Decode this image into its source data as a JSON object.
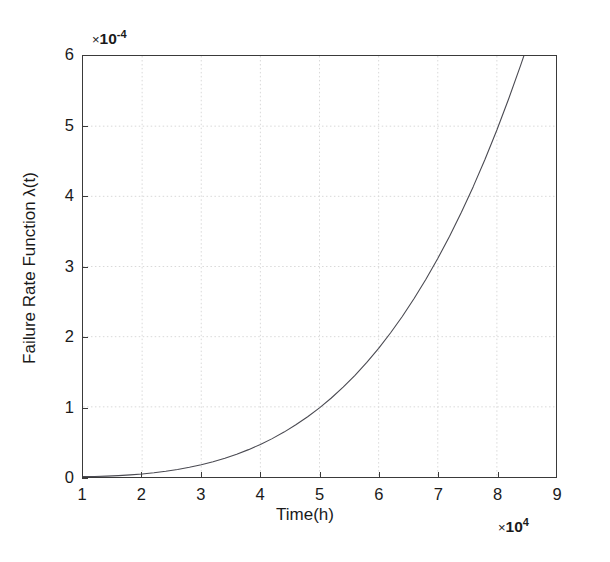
{
  "figure": {
    "background_color": "#ffffff",
    "axis_color": "#3a3a3a",
    "grid_color": "#d9d9d9",
    "curve_color": "#4a4a52"
  },
  "axes": {
    "x_title": "Time(h)",
    "y_title": "Failure Rate Function λ(t)",
    "x_exponent_times": "×",
    "x_exponent_base": "10",
    "x_exponent_power": "4",
    "y_exponent_times": "×",
    "y_exponent_base": "10",
    "y_exponent_power": "-4",
    "x_ticks": [
      "1",
      "2",
      "3",
      "4",
      "5",
      "6",
      "7",
      "8",
      "9"
    ],
    "y_ticks": [
      "0",
      "1",
      "2",
      "3",
      "4",
      "5",
      "6"
    ]
  },
  "chart_data": {
    "type": "line",
    "title": "",
    "subtitle": "",
    "xlabel": "Time(h)",
    "ylabel": "Failure Rate Function λ(t)",
    "x_scale_factor": 10000,
    "y_scale_factor": 0.0001,
    "x_exponent_label": "×10^4",
    "y_exponent_label": "×10^-4",
    "xlim": [
      1,
      9
    ],
    "ylim": [
      0,
      6
    ],
    "xticks": [
      1,
      2,
      3,
      4,
      5,
      6,
      7,
      8,
      9
    ],
    "yticks": [
      0,
      1,
      2,
      3,
      4,
      5,
      6
    ],
    "grid": true,
    "grid_style": "dotted-light",
    "legend": null,
    "legend_position": "none",
    "annotations": [],
    "series": [
      {
        "name": "Failure Rate Function λ(t)",
        "color": "#4a4a52",
        "line_width": 1.1,
        "marker": "none",
        "x_units": "x10^4 hours",
        "y_units": "x10^-4 per hour",
        "x": [
          1.0,
          1.2,
          1.4,
          1.6,
          1.8,
          2.0,
          2.2,
          2.4,
          2.6,
          2.8,
          3.0,
          3.2,
          3.4,
          3.6,
          3.8,
          4.0,
          4.2,
          4.4,
          4.6,
          4.8,
          5.0,
          5.2,
          5.4,
          5.6,
          5.8,
          6.0,
          6.2,
          6.4,
          6.6,
          6.8,
          7.0,
          7.2,
          7.4,
          7.6,
          7.8,
          8.0,
          8.2,
          8.4,
          8.65
        ],
        "y": [
          0.005,
          0.008,
          0.013,
          0.02,
          0.03,
          0.043,
          0.06,
          0.081,
          0.107,
          0.138,
          0.175,
          0.218,
          0.268,
          0.325,
          0.39,
          0.464,
          0.547,
          0.64,
          0.744,
          0.859,
          0.986,
          1.126,
          1.28,
          1.449,
          1.633,
          1.834,
          2.052,
          2.288,
          2.543,
          2.818,
          3.114,
          3.432,
          3.773,
          4.138,
          4.528,
          4.945,
          5.39,
          5.863,
          6.48
        ]
      }
    ]
  }
}
